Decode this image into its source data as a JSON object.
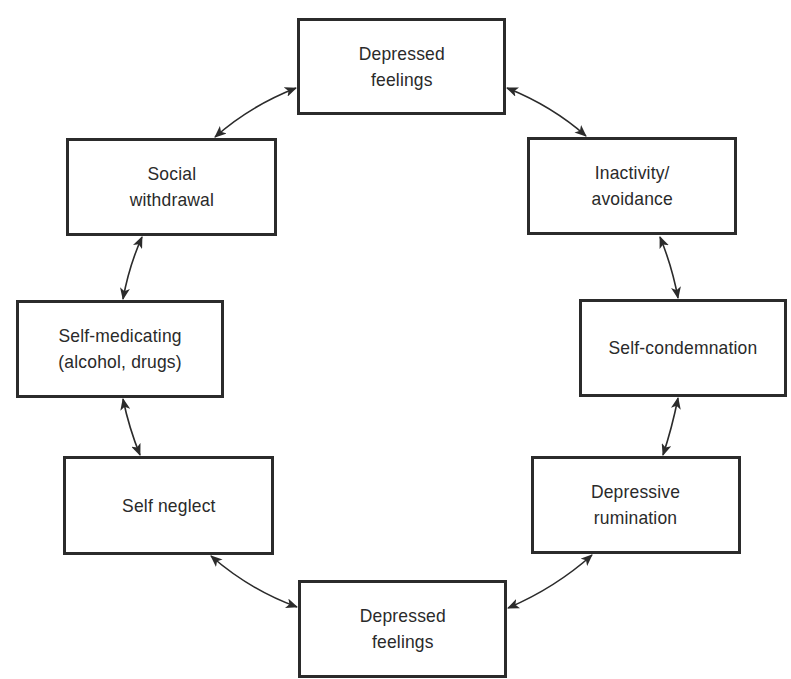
{
  "diagram": {
    "type": "cycle",
    "colors": {
      "stroke": "#2b2b2b",
      "text": "#2a2a2a",
      "background": "#ffffff"
    },
    "nodes": [
      {
        "id": "depressed-feelings-top",
        "label": "Depressed\nfeelings",
        "x": 297,
        "y": 18,
        "w": 209,
        "h": 97
      },
      {
        "id": "inactivity-avoidance",
        "label": "Inactivity/\navoidance",
        "x": 527,
        "y": 137,
        "w": 210,
        "h": 98
      },
      {
        "id": "self-condemnation",
        "label": "Self-condemnation",
        "x": 579,
        "y": 299,
        "w": 208,
        "h": 98
      },
      {
        "id": "depressive-rumination",
        "label": "Depressive\nrumination",
        "x": 531,
        "y": 456,
        "w": 210,
        "h": 98
      },
      {
        "id": "depressed-feelings-bottom",
        "label": "Depressed\nfeelings",
        "x": 298,
        "y": 580,
        "w": 209,
        "h": 98
      },
      {
        "id": "self-neglect",
        "label": "Self neglect",
        "x": 63,
        "y": 456,
        "w": 211,
        "h": 99
      },
      {
        "id": "self-medicating",
        "label": "Self-medicating\n(alcohol, drugs)",
        "x": 16,
        "y": 300,
        "w": 208,
        "h": 98
      },
      {
        "id": "social-withdrawal",
        "label": "Social\nwithdrawal",
        "x": 66,
        "y": 138,
        "w": 211,
        "h": 98
      }
    ],
    "edges": [
      {
        "from": "depressed-feelings-top",
        "to": "inactivity-avoidance",
        "bidirectional": true
      },
      {
        "from": "inactivity-avoidance",
        "to": "self-condemnation",
        "bidirectional": true
      },
      {
        "from": "self-condemnation",
        "to": "depressive-rumination",
        "bidirectional": true
      },
      {
        "from": "depressive-rumination",
        "to": "depressed-feelings-bottom",
        "bidirectional": true
      },
      {
        "from": "depressed-feelings-bottom",
        "to": "self-neglect",
        "bidirectional": true
      },
      {
        "from": "self-neglect",
        "to": "self-medicating",
        "bidirectional": true
      },
      {
        "from": "self-medicating",
        "to": "social-withdrawal",
        "bidirectional": true
      },
      {
        "from": "social-withdrawal",
        "to": "depressed-feelings-top",
        "bidirectional": true
      }
    ]
  }
}
